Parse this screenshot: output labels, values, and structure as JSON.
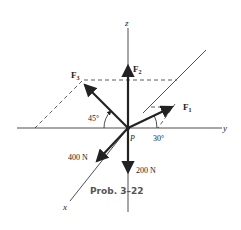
{
  "diagram": {
    "axes": {
      "x_label": "x",
      "y_label": "y",
      "z_label": "z",
      "origin_label": "P"
    },
    "forces": {
      "F1": {
        "label": "F",
        "subscript": "1",
        "angle_label": "30°"
      },
      "F2": {
        "label": "F",
        "subscript": "2"
      },
      "F3": {
        "label": "F",
        "subscript": "3",
        "angle_label": "45°"
      },
      "x_force": {
        "label": "400 N"
      },
      "down_force": {
        "label": "200 N"
      }
    },
    "caption": "Prob. 3–22"
  },
  "colors": {
    "line": "#222222",
    "caption": "#555555"
  }
}
